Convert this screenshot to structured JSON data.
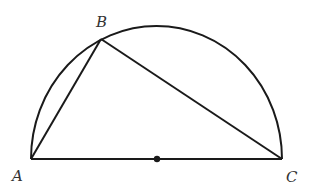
{
  "diagram": {
    "type": "geometry",
    "stroke_color": "#1a1a1a",
    "points": {
      "A": {
        "label": "A",
        "x": 31,
        "y": 159
      },
      "B": {
        "label": "B",
        "x": 101,
        "y": 39
      },
      "C": {
        "label": "C",
        "x": 282,
        "y": 159
      },
      "O": {
        "label": "",
        "x": 157,
        "y": 159
      }
    },
    "segments": [
      "AB",
      "BC",
      "AC"
    ],
    "arc": "semicircle over AC",
    "labels": {
      "A": "A",
      "B": "B",
      "C": "C"
    }
  }
}
